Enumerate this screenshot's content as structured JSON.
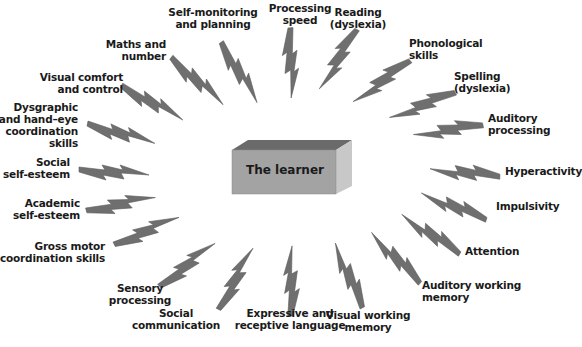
{
  "diagram": {
    "center": {
      "label": "The learner"
    },
    "colors": {
      "bolt": "#6f6f6f",
      "bolt_edge": "#5a5a5a",
      "box_front": "#a3a3a3",
      "box_top": "#6a6a6a",
      "box_side": "#c8c8c8",
      "text": "#1a1a1a"
    },
    "factors": [
      {
        "id": "self-monitoring",
        "label": "Self-monitoring\nand planning"
      },
      {
        "id": "processing-speed",
        "label": "Processing\nspeed"
      },
      {
        "id": "reading",
        "label": "Reading\n(dyslexia)"
      },
      {
        "id": "phonological",
        "label": "Phonological\nskills"
      },
      {
        "id": "spelling",
        "label": "Spelling\n(dyslexia)"
      },
      {
        "id": "auditory-processing",
        "label": "Auditory\nprocessing"
      },
      {
        "id": "hyperactivity",
        "label": "Hyperactivity"
      },
      {
        "id": "impulsivity",
        "label": "Impulsivity"
      },
      {
        "id": "attention",
        "label": "Attention"
      },
      {
        "id": "auditory-working-memory",
        "label": "Auditory working\nmemory"
      },
      {
        "id": "visual-working-memory",
        "label": "Visual working\nmemory"
      },
      {
        "id": "expressive-receptive-language",
        "label": "Expressive and\nreceptive language"
      },
      {
        "id": "social-communication",
        "label": "Social\ncommunication"
      },
      {
        "id": "sensory-processing",
        "label": "Sensory\nprocessing"
      },
      {
        "id": "gross-motor",
        "label": "Gross motor\ncoordination skills"
      },
      {
        "id": "academic-self-esteem",
        "label": "Academic\nself-esteem"
      },
      {
        "id": "social-self-esteem",
        "label": "Social\nself-esteem"
      },
      {
        "id": "dysgraphic",
        "label": "Dysgraphic\nand hand–eye\ncoordination\nskills"
      },
      {
        "id": "visual-comfort",
        "label": "Visual comfort\nand control"
      },
      {
        "id": "maths",
        "label": "Maths and\nnumber"
      }
    ]
  }
}
